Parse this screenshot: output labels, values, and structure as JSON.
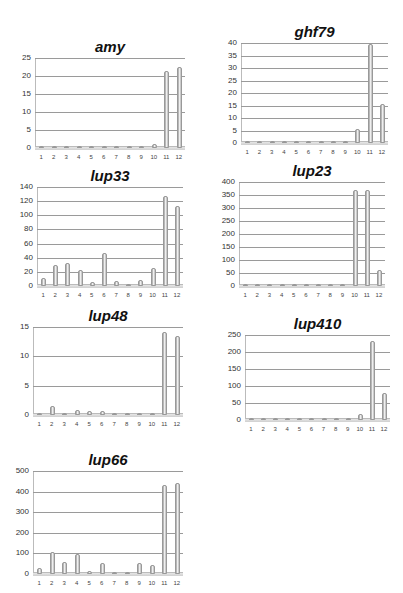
{
  "chart_data": [
    {
      "type": "bar",
      "title": "amy",
      "categories": [
        "1",
        "2",
        "3",
        "4",
        "5",
        "6",
        "7",
        "8",
        "9",
        "10",
        "11",
        "12"
      ],
      "values": [
        0.5,
        0.6,
        0.2,
        0.2,
        0.2,
        0.1,
        0.1,
        0.1,
        0.1,
        1.2,
        21.5,
        22.5
      ],
      "xlabel": "",
      "ylabel": "",
      "yticks": [
        0,
        5,
        10,
        15,
        20,
        25
      ],
      "ylim": [
        0,
        25
      ],
      "grid": true,
      "legend": "none"
    },
    {
      "type": "bar",
      "title": "ghf79",
      "categories": [
        "1",
        "2",
        "3",
        "4",
        "5",
        "6",
        "7",
        "8",
        "9",
        "10",
        "11",
        "12"
      ],
      "values": [
        0,
        0,
        0,
        0,
        0,
        0,
        0,
        0,
        0,
        5.5,
        39.5,
        15.5
      ],
      "xlabel": "",
      "ylabel": "",
      "yticks": [
        0,
        5,
        10,
        15,
        20,
        25,
        30,
        35,
        40
      ],
      "ylim": [
        0,
        40
      ],
      "grid": true,
      "legend": "none"
    },
    {
      "type": "bar",
      "title": "lup33",
      "categories": [
        "1",
        "2",
        "3",
        "4",
        "5",
        "6",
        "7",
        "8",
        "9",
        "10",
        "11",
        "12"
      ],
      "values": [
        11,
        29,
        33,
        23,
        6,
        47,
        7,
        2,
        8,
        25,
        127,
        113
      ],
      "xlabel": "",
      "ylabel": "",
      "yticks": [
        0,
        20,
        40,
        60,
        80,
        100,
        120,
        140
      ],
      "ylim": [
        0,
        140
      ],
      "grid": true,
      "legend": "none"
    },
    {
      "type": "bar",
      "title": "lup23",
      "categories": [
        "1",
        "2",
        "3",
        "4",
        "5",
        "6",
        "7",
        "8",
        "9",
        "10",
        "11",
        "12"
      ],
      "values": [
        5,
        3,
        4,
        3,
        4,
        3,
        4,
        4,
        3,
        370,
        370,
        60
      ],
      "xlabel": "",
      "ylabel": "",
      "yticks": [
        0,
        50,
        100,
        150,
        200,
        250,
        300,
        350,
        400
      ],
      "ylim": [
        0,
        400
      ],
      "grid": true,
      "legend": "none"
    },
    {
      "type": "bar",
      "title": "lup48",
      "categories": [
        "1",
        "2",
        "3",
        "4",
        "5",
        "6",
        "7",
        "8",
        "9",
        "10",
        "11",
        "12"
      ],
      "values": [
        0.2,
        1.6,
        0.2,
        0.8,
        0.6,
        0.6,
        0.2,
        0.1,
        0.2,
        0.4,
        14.2,
        13.5
      ],
      "xlabel": "",
      "ylabel": "",
      "yticks": [
        0,
        5,
        10,
        15
      ],
      "ylim": [
        0,
        15
      ],
      "grid": true,
      "legend": "none"
    },
    {
      "type": "bar",
      "title": "lup410",
      "categories": [
        "1",
        "2",
        "3",
        "4",
        "5",
        "6",
        "7",
        "8",
        "9",
        "10",
        "11",
        "12"
      ],
      "values": [
        3,
        3,
        3,
        3,
        3,
        3,
        3,
        4,
        3,
        18,
        232,
        78
      ],
      "xlabel": "",
      "ylabel": "",
      "yticks": [
        0,
        50,
        100,
        150,
        200,
        250
      ],
      "ylim": [
        0,
        250
      ],
      "grid": true,
      "legend": "none"
    },
    {
      "type": "bar",
      "title": "lup66",
      "categories": [
        "1",
        "2",
        "3",
        "4",
        "5",
        "6",
        "7",
        "8",
        "9",
        "10",
        "11",
        "12"
      ],
      "values": [
        30,
        108,
        60,
        95,
        15,
        55,
        5,
        5,
        55,
        45,
        430,
        440
      ],
      "xlabel": "",
      "ylabel": "",
      "yticks": [
        0,
        100,
        200,
        300,
        400,
        500
      ],
      "ylim": [
        0,
        500
      ],
      "grid": true,
      "legend": "none"
    }
  ],
  "layout": [
    {
      "left": 5,
      "top": 18,
      "plotLeft": 30,
      "plotTop": 40,
      "plotW": 150,
      "plotH": 90
    },
    {
      "left": 205,
      "top": 10,
      "plotLeft": 36,
      "plotTop": 33,
      "plotW": 147,
      "plotH": 100
    },
    {
      "left": 5,
      "top": 160,
      "plotLeft": 32,
      "plotTop": 27,
      "plotW": 146,
      "plotH": 99
    },
    {
      "left": 205,
      "top": 160,
      "plotLeft": 34,
      "plotTop": 22,
      "plotW": 146,
      "plotH": 104
    },
    {
      "left": 5,
      "top": 305,
      "plotLeft": 28,
      "plotTop": 22,
      "plotW": 150,
      "plotH": 88
    },
    {
      "left": 205,
      "top": 310,
      "plotLeft": 40,
      "plotTop": 25,
      "plotW": 145,
      "plotH": 85
    },
    {
      "left": 5,
      "top": 450,
      "plotLeft": 28,
      "plotTop": 21,
      "plotW": 150,
      "plotH": 103
    }
  ]
}
